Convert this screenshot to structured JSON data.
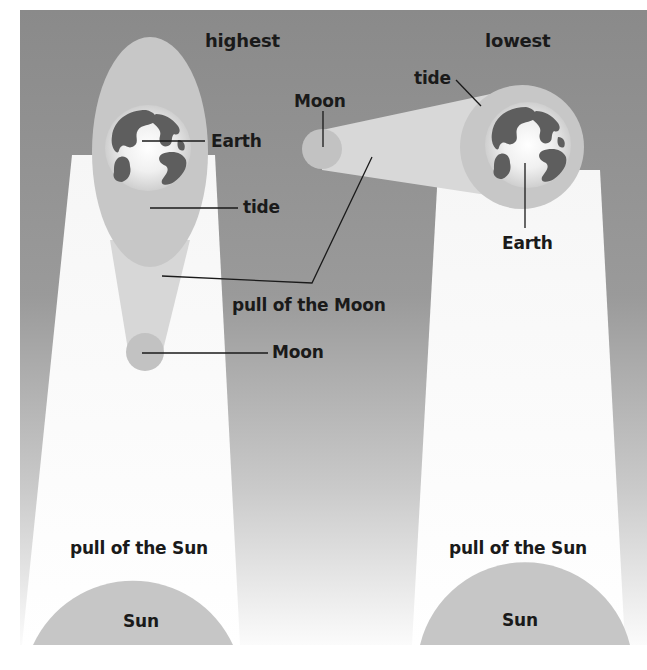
{
  "diagram": {
    "colors": {
      "background_top": "#8c8c8c",
      "background_bottom": "#fbfbfb",
      "sun_beam": "#fdfdfd",
      "body_fill": "#c8c8c8",
      "tide_bulge": "#c4c4c4",
      "moon_beam": "#d9d9d9",
      "continents": "#5f5f5f",
      "label_text": "#1a1a1a",
      "leader_line": "#1a1a1a"
    },
    "left_panel": {
      "title": "highest",
      "earth_label": "Earth",
      "tide_label": "tide",
      "moon_pull_label": "pull of the Moon",
      "moon_label": "Moon",
      "sun_pull_label": "pull of the Sun",
      "sun_label": "Sun"
    },
    "right_panel": {
      "title": "lowest",
      "tide_label": "tide",
      "moon_label": "Moon",
      "earth_label": "Earth",
      "sun_pull_label": "pull of the Sun",
      "sun_label": "Sun"
    }
  }
}
